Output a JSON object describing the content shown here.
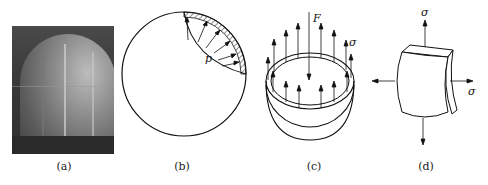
{
  "figure": {
    "panels": [
      {
        "id": "a",
        "caption": "(a)",
        "content": "photograph of spherical pressure vessel (storage sphere)"
      },
      {
        "id": "b",
        "caption": "(b)",
        "content": "sphere cross-section with internal pressure arrows",
        "labels": {
          "pressure": "p"
        }
      },
      {
        "id": "c",
        "caption": "(c)",
        "content": "hemisphere free body with resultant force and wall stress",
        "labels": {
          "force": "F",
          "stress": "σ"
        }
      },
      {
        "id": "d",
        "caption": "(d)",
        "content": "shell element under biaxial stress",
        "labels": {
          "stress_top": "σ",
          "stress_right": "σ"
        }
      }
    ]
  }
}
